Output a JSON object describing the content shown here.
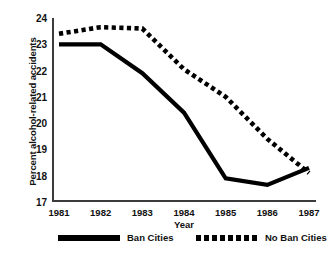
{
  "chart_data": {
    "type": "line",
    "title": "",
    "xlabel": "Year",
    "ylabel": "Percent alcohol-related accidents",
    "categories": [
      "1981",
      "1982",
      "1983",
      "1984",
      "1985",
      "1986",
      "1987"
    ],
    "x": [
      1981,
      1982,
      1983,
      1984,
      1985,
      1986,
      1987
    ],
    "xlim": [
      1981,
      1987
    ],
    "ylim": [
      17,
      24
    ],
    "yticks": [
      17,
      18,
      19,
      20,
      21,
      22,
      23,
      24
    ],
    "ytick_labels": [
      "17",
      "18",
      "19",
      "20",
      "21",
      "22",
      "23",
      "24"
    ],
    "xticks": [
      1981,
      1982,
      1983,
      1984,
      1985,
      1986,
      1987
    ],
    "xtick_labels": [
      "1981",
      "1982",
      "1983",
      "1984",
      "1985",
      "1986",
      "1987"
    ],
    "grid": false,
    "legend_position": "bottom",
    "series": [
      {
        "name": "Ban Cities",
        "style": "solid",
        "color": "#000000",
        "values": [
          23.0,
          23.0,
          21.9,
          20.4,
          17.9,
          17.65,
          18.3
        ]
      },
      {
        "name": "No Ban Cities",
        "style": "dotted",
        "color": "#000000",
        "values": [
          23.4,
          23.65,
          23.6,
          22.05,
          21.0,
          19.4,
          18.1
        ]
      }
    ]
  },
  "legend": {
    "ban_label": "Ban Cities",
    "noban_label": "No Ban Cities"
  }
}
